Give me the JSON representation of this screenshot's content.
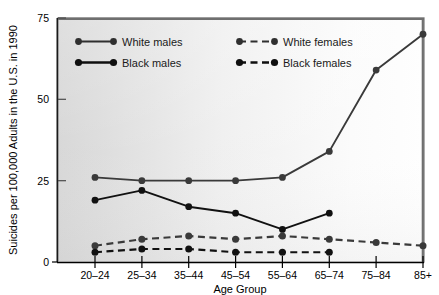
{
  "chart_data": {
    "type": "line",
    "title": "",
    "xlabel": "Age Group",
    "ylabel": "Suicides per 100,000 Adults in the U.S. in 1990",
    "categories": [
      "20–24",
      "25–34",
      "35–44",
      "45–54",
      "55–64",
      "65–74",
      "75–84",
      "85+"
    ],
    "yticks": [
      0,
      25,
      50,
      75
    ],
    "ylim": [
      0,
      75
    ],
    "grid": false,
    "legend_position": "top-inside",
    "series": [
      {
        "name": "White males",
        "style": "solid",
        "marker": "circle",
        "color": "#3a3a3a",
        "values": [
          26,
          25,
          25,
          25,
          26,
          34,
          59,
          70
        ]
      },
      {
        "name": "Black males",
        "style": "solid",
        "marker": "circle",
        "color": "#111111",
        "values": [
          19,
          22,
          17,
          15,
          10,
          15,
          null,
          null
        ]
      },
      {
        "name": "White females",
        "style": "dashed",
        "marker": "circle",
        "color": "#3a3a3a",
        "values": [
          5,
          7,
          8,
          7,
          8,
          7,
          6,
          5
        ]
      },
      {
        "name": "Black females",
        "style": "dashed",
        "marker": "circle",
        "color": "#111111",
        "values": [
          3,
          4,
          4,
          3,
          3,
          3,
          null,
          null
        ]
      }
    ]
  },
  "legend": {
    "entries": [
      {
        "label": "White males",
        "style": "solid"
      },
      {
        "label": "Black males",
        "style": "solid"
      },
      {
        "label": "White females",
        "style": "dashed"
      },
      {
        "label": "Black females",
        "style": "dashed"
      }
    ]
  },
  "axes": {
    "y_tick_labels": [
      "75",
      "50",
      "25",
      "0"
    ],
    "x_tick_labels": [
      "20–24",
      "25–34",
      "35–44",
      "45–54",
      "55–64",
      "65–74",
      "75–84",
      "85+"
    ],
    "y_axis_title": "Suicides per 100,000 Adults in the U.S. in 1990",
    "x_axis_title": "Age Group"
  },
  "colors": {
    "plot_bg_left": "#d8d8d8",
    "plot_bg_right": "#fdfdfd",
    "frame": "#707070",
    "line_dark": "#141414",
    "line_mid": "#3a3a3a"
  }
}
